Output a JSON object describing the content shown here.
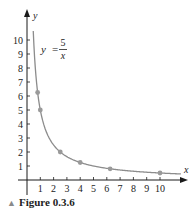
{
  "chart_data": {
    "type": "line",
    "title": "",
    "equation": {
      "lhs": "y =",
      "numerator": "5",
      "denominator": "x"
    },
    "xlabel": "x",
    "ylabel": "y",
    "xlim": [
      0,
      10.5
    ],
    "ylim": [
      0,
      10.8
    ],
    "x_ticks": [
      1,
      2,
      3,
      4,
      5,
      6,
      7,
      8,
      9,
      10
    ],
    "y_ticks": [
      1,
      2,
      3,
      4,
      5,
      6,
      7,
      8,
      9,
      10
    ],
    "grid": false,
    "series": [
      {
        "name": "y = 5/x",
        "function": "5/x",
        "marked_points": [
          {
            "x": 0.8,
            "y": 6.25
          },
          {
            "x": 1,
            "y": 5
          },
          {
            "x": 2.5,
            "y": 2
          },
          {
            "x": 4,
            "y": 1.25
          },
          {
            "x": 6.25,
            "y": 0.8
          },
          {
            "x": 10,
            "y": 0.5
          }
        ]
      }
    ]
  },
  "caption": {
    "marker": "▲",
    "text": "Figure 0.3.6"
  },
  "colors": {
    "curve": "#8c8c8c",
    "point": "#9a9a9a",
    "axis": "#1a1a1a",
    "text": "#222222"
  }
}
